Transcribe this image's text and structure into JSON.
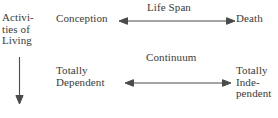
{
  "figure": {
    "background_color": "#ffffff",
    "text_color": "#3a3a3a",
    "line_color": "#4a4a4a",
    "scan_artifact_text": "   ' ' '  '  '"
  },
  "labels": {
    "activities_of_living": "Activi-\nties of\nLiving",
    "conception": "Conception",
    "death": "Death",
    "life_span": "Life Span",
    "continuum": "Continuum",
    "totally_dependent": "Totally\nDependent",
    "totally_independent": "Totally\nInde-\npendent"
  },
  "arrows": [
    {
      "name": "life-span-arrow",
      "label": "Life Span",
      "from": "Conception",
      "to": "Death",
      "style": "double-headed-horizontal"
    },
    {
      "name": "continuum-arrow",
      "label": "Continuum",
      "from": "Totally Dependent",
      "to": "Totally Independent",
      "style": "double-headed-horizontal"
    },
    {
      "name": "activities-of-living-arrow",
      "label": "",
      "from": "Activities of Living",
      "to": "",
      "style": "single-headed-down"
    }
  ]
}
